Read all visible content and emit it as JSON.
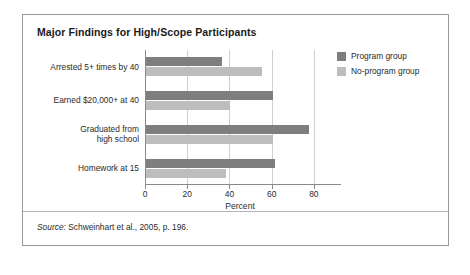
{
  "figure": {
    "title": "Major Findings for High/Scope Participants",
    "source_prefix": "Source:",
    "source_text": " Schweinhart et al., 2005, p. 196."
  },
  "legend": {
    "items": [
      {
        "label": "Program group",
        "color": "#7e7e7e",
        "swatch_name": "legend-swatch-program"
      },
      {
        "label": "No-program group",
        "color": "#bdbdbd",
        "swatch_name": "legend-swatch-no-program"
      }
    ]
  },
  "chart_data": {
    "type": "bar",
    "orientation": "horizontal",
    "title": "Major Findings for High/Scope Participants",
    "xlabel": "Percent",
    "ylabel": "",
    "xlim": [
      0,
      90
    ],
    "xticks": [
      0,
      20,
      40,
      60,
      80
    ],
    "grid": true,
    "legend_position": "right",
    "categories": [
      "Arrested 5+ times by 40",
      "Earned $20,000+ at 40",
      "Graduated from\nhigh school",
      "Homework at 15"
    ],
    "category_lines": [
      [
        "Arrested 5+ times by 40"
      ],
      [
        "Earned $20,000+ at 40"
      ],
      [
        "Graduated from",
        "high school"
      ],
      [
        "Homework at 15"
      ]
    ],
    "series": [
      {
        "name": "Program group",
        "color": "#7e7e7e",
        "values": [
          36,
          60,
          77,
          61
        ]
      },
      {
        "name": "No-program group",
        "color": "#bdbdbd",
        "values": [
          55,
          40,
          60,
          38
        ]
      }
    ]
  }
}
